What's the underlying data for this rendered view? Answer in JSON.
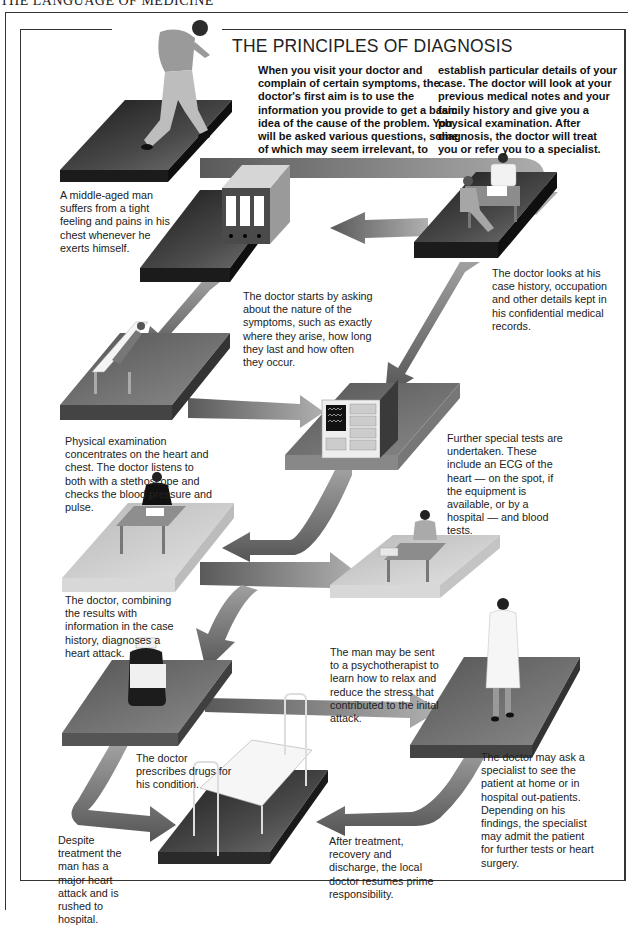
{
  "page": {
    "running_head": "THE LANGUAGE OF MEDICINE",
    "title": "THE PRINCIPLES OF DIAGNOSIS"
  },
  "intro": {
    "column_1": "When you visit your doctor and complain of certain symptoms, the doctor's first aim is to use the information you provide to get a basic idea of the cause of the problem. You will be asked various questions, some of which may seem irrelevant, to",
    "column_2": "establish particular details of your case. The doctor will look at your previous medical notes and your family history and give you a physical examination. After diagnosis, the doctor will treat you or refer you to a specialist."
  },
  "steps": [
    {
      "id": "symptoms",
      "illustration": "running-man",
      "caption": "A middle-aged man suffers from a tight feeling and pains in his chest whenever he exerts himself."
    },
    {
      "id": "case-history",
      "illustration": "doctor-consultation",
      "caption": "The doctor looks at his case history, occupation and other details kept in his confidential medical records."
    },
    {
      "id": "questions",
      "illustration": "medical-record-files",
      "caption": "The doctor starts by asking about the nature of the symptoms, such as exactly where they arise, how long they last and how often they occur."
    },
    {
      "id": "physical-exam",
      "illustration": "patient-on-couch",
      "caption": "Physical examination concentrates on the heart and chest. The doctor listens to both with a stethoscope and checks the blood pressure and pulse."
    },
    {
      "id": "special-tests",
      "illustration": "ecg-machine",
      "caption": "Further special tests are undertaken. These include an ECG of the heart — on the spot, if the equipment is available, or by a hospital — and blood tests."
    },
    {
      "id": "diagnosis",
      "illustration": "doctor-at-desk",
      "caption": "The doctor, combining the results with information in the case history, diagnoses a heart attack."
    },
    {
      "id": "psychotherapy",
      "illustration": "psychotherapist-at-desk",
      "caption": "The man may be sent to a psychotherapist to learn how to relax and reduce the stress that contributed to the inital attack."
    },
    {
      "id": "prescription",
      "illustration": "medicine-bottle",
      "caption": "The doctor prescribes drugs for his condition."
    },
    {
      "id": "specialist",
      "illustration": "specialist-in-white-coat",
      "caption": "The doctor may ask a specialist to see the patient at home or in hospital out-patients. Depending on his findings, the specialist may admit the patient for further tests or heart surgery."
    },
    {
      "id": "hospital",
      "illustration": "hospital-bed",
      "caption": "Despite treatment the man has a major heart attack and is rushed to hospital."
    },
    {
      "id": "discharge",
      "illustration": "hospital-bed",
      "caption": "After treatment, recovery and discharge, the local doctor resumes prime responsibility."
    }
  ],
  "colors": {
    "dark_platform": "#2a2a2a",
    "mid_platform": "#6e6e6e",
    "light_platform": "#c9c9c9",
    "arrow": "#8a8a8a",
    "text": "#1a1a1a"
  }
}
